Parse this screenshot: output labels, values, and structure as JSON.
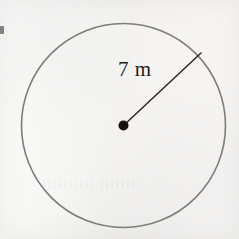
{
  "figure": {
    "kind": "geometry-diagram",
    "shape": "circle",
    "background_color": "#f6f5f3",
    "width": 239,
    "height": 239
  },
  "circle": {
    "name": "circle-outline",
    "center_x": 123.5,
    "center_y": 125.5,
    "radius_px": 102,
    "stroke_color": "#7f7d7b",
    "stroke_width": 1.6,
    "fill": "none"
  },
  "center_point": {
    "name": "center-dot",
    "x": 123.5,
    "y": 125.5,
    "dot_radius_px": 5,
    "color": "#141211"
  },
  "radius_segment": {
    "name": "radius-line",
    "from_x": 123.5,
    "from_y": 125.5,
    "to_x": 201,
    "to_y": 53,
    "stroke_color": "#2b2826",
    "stroke_width": 1.5
  },
  "radius_label": {
    "text": "7 m",
    "value": 7,
    "unit": "m",
    "color": "#231f1e",
    "x": 118,
    "y": 57
  },
  "artifacts": {
    "show_through_text": "iiiiiiiiii iiiiiii",
    "edge_mark": "scan-edge-smudge"
  }
}
